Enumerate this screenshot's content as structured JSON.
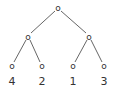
{
  "tree": {
    "node_glyph": "o",
    "root": {
      "x": 58,
      "y": 8
    },
    "level2": [
      {
        "x": 28,
        "y": 37
      },
      {
        "x": 89,
        "y": 37
      }
    ],
    "leaves": [
      {
        "x": 12,
        "y": 66,
        "label": "4"
      },
      {
        "x": 42,
        "y": 66,
        "label": "2"
      },
      {
        "x": 73,
        "y": 66,
        "label": "1"
      },
      {
        "x": 104,
        "y": 66,
        "label": "3"
      }
    ]
  }
}
